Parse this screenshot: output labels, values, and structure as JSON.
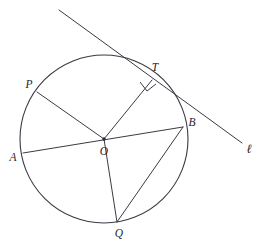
{
  "diagram": {
    "type": "geometry-diagram",
    "canvas": {
      "width": 268,
      "height": 247
    },
    "stroke_color": "#3a3a44",
    "label_color": "#1e1e26",
    "background_color": "#ffffff",
    "circle": {
      "name": "main-circle",
      "center_label": "O",
      "center": {
        "x": 104,
        "y": 139
      },
      "radius": 84
    },
    "points": [
      {
        "id": "P",
        "label": "P",
        "x": 37,
        "y": 92,
        "label_x": 29,
        "label_y": 85
      },
      {
        "id": "A",
        "label": "A",
        "x": 23,
        "y": 153,
        "label_x": 13,
        "label_y": 158
      },
      {
        "id": "O",
        "label": "O",
        "x": 104,
        "y": 139,
        "label_x": 104,
        "label_y": 152
      },
      {
        "id": "T",
        "label": "T",
        "x": 152,
        "y": 80,
        "label_x": 155,
        "label_y": 68
      },
      {
        "id": "B",
        "label": "B",
        "x": 183,
        "y": 127,
        "label_x": 192,
        "label_y": 123
      },
      {
        "id": "Q",
        "label": "Q",
        "x": 117,
        "y": 222,
        "label_x": 119,
        "label_y": 234
      }
    ],
    "segments": [
      {
        "id": "PO",
        "name": "radius-p-o",
        "from": "P",
        "to": "O"
      },
      {
        "id": "AB",
        "name": "diameter-a-b",
        "from": "A",
        "to": "B"
      },
      {
        "id": "OT",
        "name": "radius-o-t",
        "from": "O",
        "to": "T"
      },
      {
        "id": "BQ",
        "name": "chord-b-q",
        "from": "B",
        "to": "Q"
      },
      {
        "id": "OQ",
        "name": "radius-o-q",
        "from": "O",
        "to": "Q"
      }
    ],
    "tangent_line": {
      "name": "tangent-line-l",
      "label": "ℓ",
      "tangent_point": "T",
      "start": {
        "x": 59,
        "y": 10
      },
      "end": {
        "x": 242,
        "y": 143
      },
      "label_x": 249,
      "label_y": 150
    },
    "right_angle": {
      "name": "right-angle-marker-at-t",
      "vertex": "T",
      "size": 9,
      "description": "90 degree angle between radius OT and tangent line"
    }
  }
}
